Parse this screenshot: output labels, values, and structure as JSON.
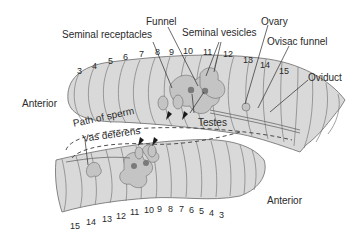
{
  "diagram": {
    "colors": {
      "body_fill": "#d9d9d9",
      "body_shade": "#c4c4c4",
      "segment_line": "#6a6a6a",
      "organ_dark": "#7a7a7a",
      "text": "#2a2a2a"
    },
    "labels": {
      "seminal_receptacles": "Seminal receptacles",
      "funnel": "Funnel",
      "seminal_vesicles": "Seminal vesicles",
      "ovary": "Ovary",
      "ovisac_funnel": "Ovisac funnel",
      "oviduct": "Oviduct",
      "anterior_top": "Anterior",
      "testes": "Testes",
      "path_of_sperm": "Path of sperm",
      "vas_deferens": "Vas deferens",
      "anterior_bottom": "Anterior"
    },
    "top_worm_segments": [
      "3",
      "4",
      "5",
      "6",
      "7",
      "8",
      "9",
      "10",
      "11",
      "12",
      "13",
      "14",
      "15"
    ],
    "bottom_worm_segments": [
      "15",
      "14",
      "13",
      "12",
      "11",
      "10",
      "9",
      "8",
      "7",
      "6",
      "5",
      "4",
      "3"
    ]
  }
}
